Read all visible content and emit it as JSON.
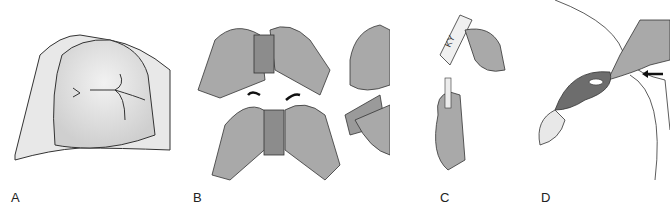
{
  "figure": {
    "panels": [
      {
        "id": "A",
        "label": "A",
        "description": "Patient buttocks draped with sheet, anal region exposed"
      },
      {
        "id": "B",
        "label": "B",
        "description": "Gloved hands unwrapping suppository from foil packet"
      },
      {
        "id": "C",
        "label": "C",
        "description": "Applying KY lubricant from tube onto suppository tip"
      },
      {
        "id": "D",
        "label": "D",
        "description": "Gloved finger inserting suppository into rectum alongside wall"
      }
    ],
    "tube_text": "KY",
    "colors": {
      "glove": "#a9a9a9",
      "outline": "#333333",
      "skin": "#e6e6e6",
      "rectum": "#6d6d6d"
    }
  }
}
